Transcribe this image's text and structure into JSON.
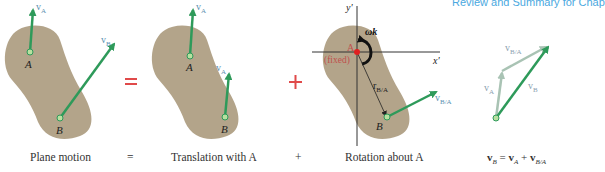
{
  "header": {
    "running_title": "Review and Summary for Chap"
  },
  "colors": {
    "body_fill": "#b3a48a",
    "arrow_green": "#2e9a5a",
    "arrow_light": "#a9c3b4",
    "operator_red": "#e04a4a",
    "fixed_red": "#c0504d",
    "label_blue": "#5a8fb0",
    "axis": "#333333"
  },
  "panels": {
    "plane_motion": {
      "caption": "Plane motion",
      "point_A": "A",
      "point_B": "B",
      "vA_label": "v",
      "vA_sub": "A",
      "vB_label": "v",
      "vB_sub": "B"
    },
    "translation": {
      "caption": "Translation with A",
      "point_A": "A",
      "point_B": "B",
      "vA_label": "v",
      "vA_sub": "A",
      "vA2_label": "v",
      "vA2_sub": "A"
    },
    "rotation": {
      "caption": "Rotation about A",
      "point_A": "A",
      "point_B": "B",
      "fixed_label": "(fixed)",
      "omega_label": "ωk",
      "axis_x": "x'",
      "axis_y": "y'",
      "r_label": "r",
      "r_sub": "B/A",
      "vBA_label": "v",
      "vBA_sub": "B/A"
    },
    "vector_sum": {
      "vA_label": "v",
      "vA_sub": "A",
      "vB_label": "v",
      "vB_sub": "B",
      "vBA_label": "v",
      "vBA_sub": "B/A",
      "equation": {
        "lhs": "v",
        "lhs_sub": "B",
        "eq": " = ",
        "t1": "v",
        "t1_sub": "A",
        "plus": " + ",
        "t2": "v",
        "t2_sub": "B/A"
      }
    }
  },
  "operators": {
    "equals_big": "=",
    "plus_big": "+",
    "equals_small": "=",
    "plus_small": "+"
  }
}
